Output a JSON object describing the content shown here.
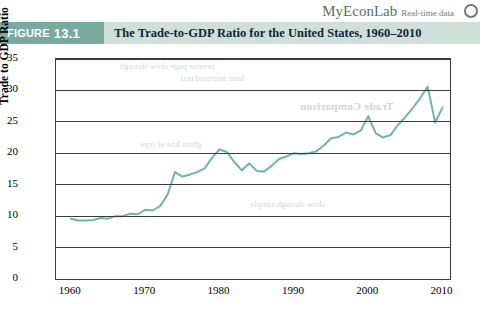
{
  "branding": {
    "myeconlab": "MyEconLab",
    "realtime": "Real-time data"
  },
  "figure": {
    "label": "FIGURE",
    "number": "13.1",
    "title": "The Trade-to-GDP Ratio for the United States, 1960–2010"
  },
  "bleed_text": [
    "reverse page show-through",
    "faint mirrored text",
    "ghost line of type",
    "Trade Comparison",
    "show-through sample"
  ],
  "chart_data": {
    "type": "line",
    "title": "The Trade-to-GDP Ratio for the United States, 1960–2010",
    "xlabel": "",
    "ylabel": "Trade to GDP Ratio",
    "xlim": [
      1958,
      2011
    ],
    "ylim": [
      0,
      35
    ],
    "ytick_labels": [
      "0",
      "5",
      "10",
      "15",
      "20",
      "25",
      "30",
      "35"
    ],
    "yticks": [
      0,
      5,
      10,
      15,
      20,
      25,
      30,
      35
    ],
    "xtick_labels": [
      "1960",
      "1970",
      "1980",
      "1990",
      "2000",
      "2010"
    ],
    "xticks": [
      1960,
      1970,
      1980,
      1990,
      2000,
      2010
    ],
    "grid": "horizontal",
    "line_color": "#6fb6a4",
    "series": [
      {
        "name": "Trade to GDP Ratio",
        "x": [
          1960,
          1961,
          1962,
          1963,
          1964,
          1965,
          1966,
          1967,
          1968,
          1969,
          1970,
          1971,
          1972,
          1973,
          1974,
          1975,
          1976,
          1977,
          1978,
          1979,
          1980,
          1981,
          1982,
          1983,
          1984,
          1985,
          1986,
          1987,
          1988,
          1989,
          1990,
          1991,
          1992,
          1993,
          1994,
          1995,
          1996,
          1997,
          1998,
          1999,
          2000,
          2001,
          2002,
          2003,
          2004,
          2005,
          2006,
          2007,
          2008,
          2009,
          2010
        ],
        "values": [
          9.6,
          9.3,
          9.3,
          9.4,
          9.7,
          9.6,
          10.0,
          10.0,
          10.4,
          10.3,
          11.0,
          10.9,
          11.6,
          13.4,
          17.0,
          16.3,
          16.6,
          17.0,
          17.6,
          19.3,
          20.6,
          20.2,
          18.6,
          17.3,
          18.4,
          17.2,
          17.1,
          18.0,
          19.1,
          19.5,
          20.0,
          19.9,
          20.0,
          20.3,
          21.2,
          22.4,
          22.6,
          23.3,
          23.0,
          23.6,
          25.9,
          23.2,
          22.5,
          22.9,
          24.5,
          25.8,
          27.2,
          28.8,
          30.6,
          24.9,
          27.3
        ]
      }
    ]
  }
}
